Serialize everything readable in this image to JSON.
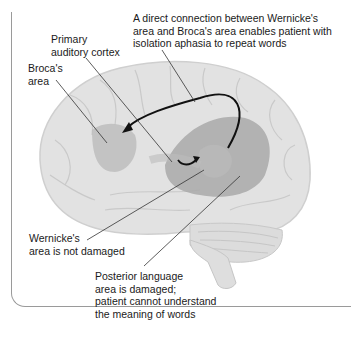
{
  "labels": {
    "connection": "A direct connection between Wernicke's\narea and Broca's area enables patient with\nisolation aphasia to repeat words",
    "primary_auditory": "Primary\nauditory cortex",
    "broca": "Broca's\narea",
    "wernicke": "Wernicke's\narea is not damaged",
    "posterior": "Posterior language\narea is damaged;\npatient cannot understand\nthe meaning of words"
  },
  "colors": {
    "brain_light": "#e4e4e4",
    "brain_mid": "#cfcfcf",
    "damaged_region": "#a8a8a8",
    "arrow": "#111111",
    "leader": "#333333",
    "frame": "#9a9a9a"
  }
}
